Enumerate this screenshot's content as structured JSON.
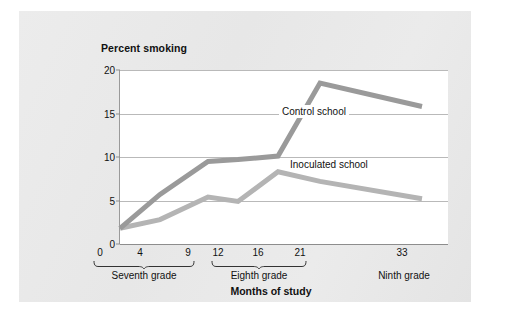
{
  "chart_data": {
    "type": "line",
    "title": "Percent smoking",
    "xlabel": "Months of study",
    "ylabel": "Percent smoking",
    "xlim": [
      0,
      35
    ],
    "ylim": [
      0,
      20
    ],
    "grid": true,
    "legend_position": "inline-annotation",
    "x": [
      0,
      4,
      9,
      12,
      16,
      21,
      33
    ],
    "x_ticks": [
      "0",
      "4",
      "9",
      "12",
      "16",
      "21",
      "33"
    ],
    "y_ticks": [
      "0",
      "5",
      "10",
      "15",
      "20"
    ],
    "series": [
      {
        "name": "Control school",
        "color": "#9a9a9a",
        "values": [
          1.8,
          5.7,
          9.5,
          9.7,
          10.1,
          18.5,
          15.8
        ]
      },
      {
        "name": "Inoculated school",
        "color": "#b4b4b4",
        "values": [
          1.8,
          2.8,
          5.4,
          4.9,
          8.3,
          7.2,
          5.2
        ]
      }
    ],
    "group_brackets": [
      {
        "label": "Seventh grade",
        "from": 0,
        "to": 9
      },
      {
        "label": "Eighth grade",
        "from": 12,
        "to": 21
      },
      {
        "label": "Ninth grade",
        "from": 33,
        "to": 33
      }
    ]
  },
  "chart": {
    "title": "Percent smoking",
    "axis_title": "Months of study",
    "y_ticks": [
      "20",
      "15",
      "10",
      "5",
      "0"
    ],
    "x_ticks": [
      "0",
      "4",
      "9",
      "12",
      "16",
      "21",
      "33"
    ],
    "series_labels": {
      "control": "Control school",
      "inoculated": "Inoculated school"
    },
    "grade_labels": {
      "seventh": "Seventh grade",
      "eighth": "Eighth grade",
      "ninth": "Ninth grade"
    },
    "colors": {
      "control_line": "#9a9a9a",
      "inoculated_line": "#b4b4b4",
      "gridline": "#b9b9b9",
      "axis": "#8d8d8d",
      "page_background": "#e9e9e9",
      "plot_background": "#ffffff",
      "text": "#111111"
    }
  }
}
